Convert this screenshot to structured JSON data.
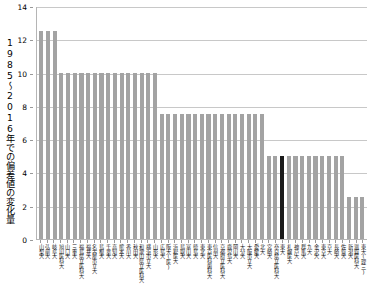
{
  "chart_data": {
    "type": "bar",
    "title": "",
    "xlabel": "",
    "ylabel": "1985～2016年での偏差値の変化量",
    "ylim": [
      0,
      14
    ],
    "yticks": [
      0,
      2,
      4,
      6,
      8,
      10,
      12,
      14
    ],
    "grid": true,
    "legend": null,
    "highlight_color": "#1a1a1a",
    "bar_color": "#a3a3a3",
    "highlighted_category": "東大",
    "categories": [
      "山梨大",
      "弘前大",
      "岐阜大",
      "旭川医科大",
      "山口大",
      "三重大",
      "福島県立医科大",
      "福井大",
      "名古屋市立大",
      "島根大",
      "千葉大",
      "高知大",
      "熊本大",
      "香川大",
      "秋田大",
      "和歌山県立医科大",
      "横浜市立大",
      "山形大",
      "広島大",
      "阪大(医)",
      "浜松医大",
      "鳥取大",
      "富山大",
      "徳島大",
      "東北大",
      "東京医科歯科大",
      "信州大",
      "京都府立医科大",
      "鹿児島大",
      "岡山大",
      "大分大",
      "大阪市立大",
      "愛媛大",
      "北大",
      "宮崎大",
      "奈良県立医科大",
      "東大",
      "札幌医大",
      "神戸大",
      "群馬大",
      "九大",
      "金沢大",
      "東京大",
      "京大",
      "長崎大",
      "佐賀大",
      "新潟大",
      "滋賀医科大",
      "東大(理三)"
    ],
    "values": [
      12.5,
      12.5,
      12.5,
      10.0,
      10.0,
      10.0,
      10.0,
      10.0,
      10.0,
      10.0,
      10.0,
      10.0,
      10.0,
      10.0,
      10.0,
      10.0,
      10.0,
      10.0,
      7.5,
      7.5,
      7.5,
      7.5,
      7.5,
      7.5,
      7.5,
      7.5,
      7.5,
      7.5,
      7.5,
      7.5,
      7.5,
      7.5,
      7.5,
      7.5,
      5.0,
      5.0,
      5.0,
      5.0,
      5.0,
      5.0,
      5.0,
      5.0,
      5.0,
      5.0,
      5.0,
      5.0,
      2.5,
      2.5,
      2.5
    ]
  }
}
